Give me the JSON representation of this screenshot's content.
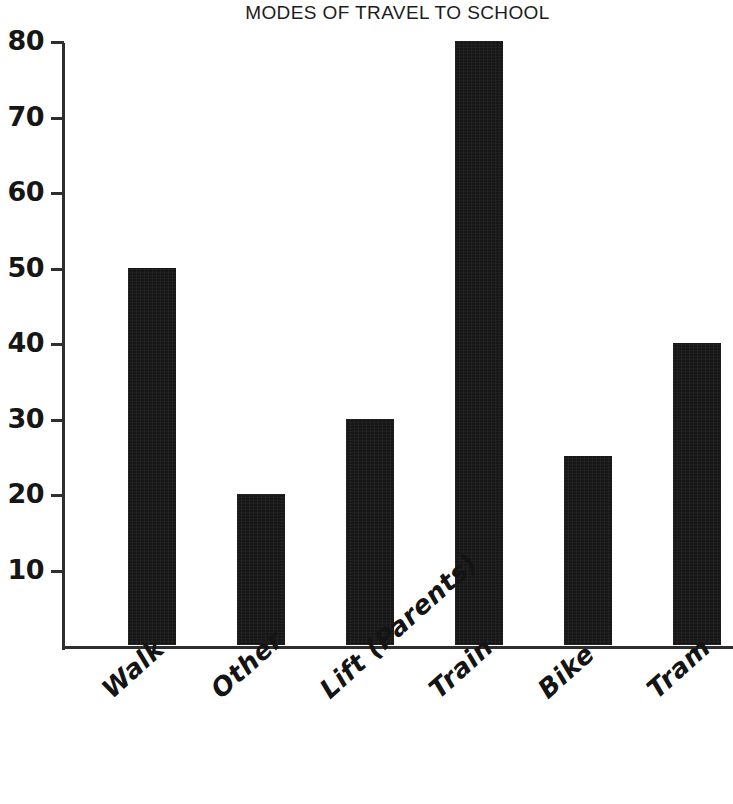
{
  "chart_data": {
    "type": "bar",
    "title": "MODES OF TRAVEL TO SCHOOL",
    "xlabel": "",
    "ylabel": "",
    "categories": [
      "Walk",
      "Other",
      "Lift (Parents)",
      "Train",
      "Bike",
      "Tram"
    ],
    "values": [
      50,
      20,
      30,
      80,
      25,
      40
    ],
    "ylim": [
      0,
      80
    ],
    "yticks": [
      10,
      20,
      30,
      40,
      50,
      60,
      70,
      80
    ],
    "ytick_labels": [
      "10",
      "20",
      "30",
      "40",
      "50",
      "60",
      "70",
      "80"
    ],
    "grid": false,
    "legend": false,
    "legend_position": "none",
    "bar_color": "#171717",
    "axis_color": "#2e2e2e",
    "background_color": "#ffffff",
    "label_rotation_degrees": -42
  },
  "axis": {
    "tick_0": "10",
    "tick_1": "20",
    "tick_2": "30",
    "tick_3": "40",
    "tick_4": "50",
    "tick_5": "60",
    "tick_6": "70",
    "tick_7": "80"
  },
  "bars": [
    {
      "label": "Walk",
      "value": 50
    },
    {
      "label": "Other",
      "value": 20
    },
    {
      "label": "Lift (Parents)",
      "value": 30
    },
    {
      "label": "Train",
      "value": 80
    },
    {
      "label": "Bike",
      "value": 25
    },
    {
      "label": "Tram",
      "value": 40
    }
  ]
}
